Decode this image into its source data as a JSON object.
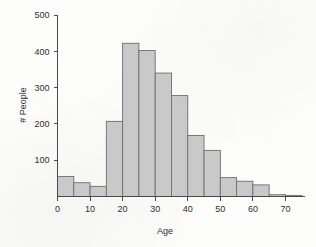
{
  "chart_data": {
    "type": "bar",
    "title": "",
    "subtitle": "",
    "xlabel": "Age",
    "ylabel": "# People",
    "xlim": [
      0,
      76
    ],
    "ylim": [
      0,
      500
    ],
    "grid": false,
    "legend": null,
    "bin_width": 5,
    "xticks": [
      0,
      10,
      20,
      30,
      40,
      50,
      60,
      70
    ],
    "xtick_labels": [
      "0",
      "10",
      "20",
      "30",
      "40",
      "50",
      "60",
      "70"
    ],
    "yticks": [
      100,
      200,
      300,
      400,
      500
    ],
    "ytick_labels": [
      "100",
      "200",
      "300",
      "400",
      "500"
    ],
    "categories": [
      "0-5",
      "5-10",
      "10-15",
      "15-20",
      "20-25",
      "25-30",
      "30-35",
      "35-40",
      "40-45",
      "45-50",
      "50-55",
      "55-60",
      "60-65",
      "65-70",
      "70-75"
    ],
    "bin_starts": [
      0,
      5,
      10,
      15,
      20,
      25,
      30,
      35,
      40,
      45,
      50,
      55,
      60,
      65,
      70
    ],
    "bin_ends": [
      5,
      10,
      15,
      20,
      25,
      30,
      35,
      40,
      45,
      50,
      55,
      60,
      65,
      70,
      75
    ],
    "values": [
      55,
      38,
      28,
      207,
      422,
      402,
      340,
      278,
      168,
      127,
      52,
      42,
      32,
      5,
      3
    ],
    "bar_fill_color": "#c9c9c9",
    "bar_edge_color": "#6e6e6e",
    "axis_color": "#4a4a4a",
    "background_color": "#fdfdfc"
  }
}
